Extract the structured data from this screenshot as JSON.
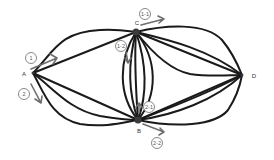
{
  "diagram": {
    "nodes": [
      {
        "id": "A",
        "label": "A",
        "x": 33,
        "y": 73,
        "lx": 24,
        "ly": 76
      },
      {
        "id": "C",
        "label": "C",
        "x": 136,
        "y": 32,
        "lx": 137,
        "ly": 25
      },
      {
        "id": "B",
        "label": "B",
        "x": 138,
        "y": 120,
        "lx": 139,
        "ly": 133
      },
      {
        "id": "D",
        "label": "D",
        "x": 242,
        "y": 75,
        "lx": 254,
        "ly": 78
      }
    ],
    "badges": [
      {
        "id": "1",
        "label": "1",
        "x": 31,
        "y": 58
      },
      {
        "id": "2",
        "label": "2",
        "x": 24,
        "y": 94
      },
      {
        "id": "1-1",
        "label": "1-1",
        "x": 145,
        "y": 14
      },
      {
        "id": "1-2",
        "label": "1-2",
        "x": 121,
        "y": 46
      },
      {
        "id": "2-1",
        "label": "2-1",
        "x": 149,
        "y": 107
      },
      {
        "id": "2-2",
        "label": "2-2",
        "x": 157,
        "y": 143
      }
    ],
    "stroke_color": "#1a1a1a",
    "arrow_color": "#6e6e6e"
  }
}
